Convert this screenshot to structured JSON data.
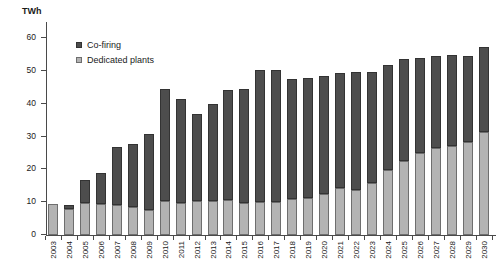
{
  "chart_data": {
    "type": "bar",
    "stacked": true,
    "title": "",
    "subtitle": "",
    "xlabel": "",
    "ylabel": "TWh",
    "ylim": [
      0,
      65
    ],
    "yticks": [
      0,
      10,
      20,
      30,
      40,
      50,
      60
    ],
    "ytick_labels": [
      "0",
      "10",
      "20",
      "30",
      "40",
      "50",
      "60"
    ],
    "grid": false,
    "legend_position": "top-left-inside",
    "categories": [
      "2003",
      "2004",
      "2005",
      "2006",
      "2007",
      "2008",
      "2009",
      "2010",
      "2011",
      "2012",
      "2013",
      "2014",
      "2015",
      "2016",
      "2017",
      "2018",
      "2019",
      "2020",
      "2021",
      "2022",
      "2023",
      "2024",
      "2025",
      "2026",
      "2027",
      "2028",
      "2029",
      "2030"
    ],
    "series": [
      {
        "name": "Dedicated plants",
        "color": "#b3b3b3",
        "values": [
          9.4,
          7.8,
          9.9,
          9.6,
          9.2,
          8.5,
          7.5,
          10.3,
          9.8,
          10.3,
          10.3,
          10.6,
          9.9,
          10.0,
          10.2,
          10.9,
          11.3,
          12.6,
          14.2,
          13.8,
          15.9,
          19.9,
          22.6,
          25.1,
          26.4,
          27.2,
          28.3,
          31.4
        ]
      },
      {
        "name": "Co-firing",
        "color": "#4d4d4d",
        "values": [
          0.0,
          1.5,
          7.0,
          9.2,
          17.8,
          19.3,
          23.3,
          34.2,
          31.8,
          26.6,
          29.7,
          33.8,
          34.6,
          40.2,
          40.0,
          36.6,
          36.6,
          35.8,
          35.2,
          36.0,
          33.8,
          31.9,
          31.0,
          28.8,
          28.2,
          27.6,
          26.4,
          26.1
        ]
      }
    ],
    "totals": [
      9.4,
      9.3,
      16.9,
      18.8,
      27.0,
      27.8,
      30.8,
      44.5,
      41.6,
      36.9,
      40.0,
      44.4,
      44.5,
      50.2,
      50.2,
      47.5,
      47.9,
      48.4,
      49.4,
      49.8,
      49.7,
      51.8,
      53.6,
      53.9,
      54.6,
      54.8,
      54.7,
      57.5
    ]
  },
  "legend": {
    "items": [
      {
        "label": "Co-firing",
        "swatch": "dark"
      },
      {
        "label": "Dedicated plants",
        "swatch": "light"
      }
    ]
  },
  "axes": {
    "y_unit_label": "TWh"
  }
}
